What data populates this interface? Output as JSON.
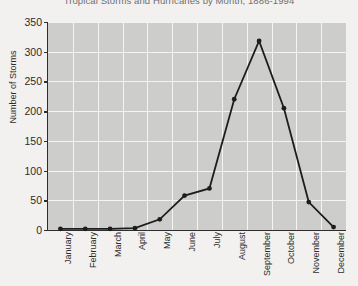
{
  "chart_data": {
    "type": "line",
    "title": "Tropical Storms and Hurricanes by Month, 1886-1994",
    "xlabel": "",
    "ylabel": "Number of Storms",
    "categories": [
      "January",
      "February",
      "March",
      "April",
      "May",
      "June",
      "July",
      "August",
      "September",
      "October",
      "November",
      "December"
    ],
    "values": [
      2,
      2,
      2,
      3,
      18,
      58,
      70,
      220,
      318,
      205,
      47,
      5
    ],
    "series": [
      {
        "name": "Number of Storms",
        "values": [
          2,
          2,
          2,
          3,
          18,
          58,
          70,
          220,
          318,
          205,
          47,
          5
        ]
      }
    ],
    "ylim": [
      0,
      350
    ],
    "yticks": [
      0,
      50,
      100,
      150,
      200,
      250,
      300,
      350
    ],
    "ytick_labels": [
      "0",
      "50",
      "100",
      "150",
      "200",
      "250",
      "300",
      "350"
    ],
    "grid": true,
    "legend": "none",
    "marker": "circle",
    "plot_background": "#cdcdcb",
    "grid_color": "#f4f4f2",
    "line_color": "#1d1d1d",
    "figure_background": "#f2f1ef",
    "title_color": "#6f6f6f"
  }
}
